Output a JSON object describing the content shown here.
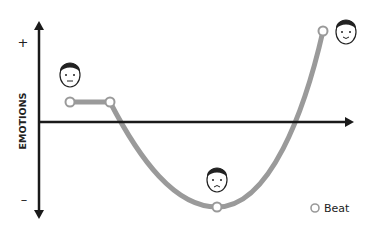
{
  "diagram": {
    "type": "story-arc",
    "y_axis": {
      "label": "EMOTIONS",
      "top_marker": "+",
      "bottom_marker": "–"
    },
    "legend": {
      "marker": "hollow-circle",
      "label": "Beat"
    },
    "beats": [
      {
        "x": 70,
        "y": 102,
        "face": "neutral"
      },
      {
        "x": 110,
        "y": 102,
        "face": "none"
      },
      {
        "x": 217,
        "y": 207,
        "face": "sad"
      },
      {
        "x": 323,
        "y": 31,
        "face": "happy"
      }
    ],
    "colors": {
      "axis": "#1a1a1a",
      "curve": "#9a9a9a",
      "beat_fill": "#ffffff"
    }
  }
}
